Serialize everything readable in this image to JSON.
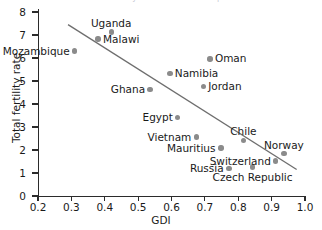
{
  "chart_data": {
    "type": "scatter",
    "title": "Global Fertility and Gender Development",
    "xlabel": "GDI",
    "ylabel": "Total fertility rate",
    "xlim": [
      0.2,
      1.0
    ],
    "ylim": [
      0,
      8
    ],
    "xticks": [
      "0.2",
      "0.3",
      "0.4",
      "0.5",
      "0.6",
      "0.7",
      "0.8",
      "0.9",
      "1.0"
    ],
    "yticks": [
      "0",
      "1",
      "2",
      "3",
      "4",
      "5",
      "6",
      "7",
      "8"
    ],
    "grid": false,
    "legend": "none",
    "point_color": "#8b8b8b",
    "trendline_color": "#6e6e6e",
    "trendline": {
      "x1": 0.29,
      "y1": 7.45,
      "x2": 0.975,
      "y2": 1.15
    },
    "points": [
      {
        "name": "Mozambique",
        "x": 0.31,
        "y": 6.3,
        "label_pos": "left"
      },
      {
        "name": "Uganda",
        "x": 0.42,
        "y": 7.13,
        "label_pos": "above"
      },
      {
        "name": "Malawi",
        "x": 0.38,
        "y": 6.82,
        "label_pos": "right"
      },
      {
        "name": "Ghana",
        "x": 0.535,
        "y": 4.62,
        "label_pos": "left"
      },
      {
        "name": "Namibia",
        "x": 0.595,
        "y": 5.33,
        "label_pos": "right"
      },
      {
        "name": "Oman",
        "x": 0.715,
        "y": 5.96,
        "label_pos": "right"
      },
      {
        "name": "Jordan",
        "x": 0.695,
        "y": 4.75,
        "label_pos": "right"
      },
      {
        "name": "Egypt",
        "x": 0.618,
        "y": 3.42,
        "label_pos": "left"
      },
      {
        "name": "Vietnam",
        "x": 0.675,
        "y": 2.56,
        "label_pos": "left"
      },
      {
        "name": "Mauritius",
        "x": 0.748,
        "y": 2.08,
        "label_pos": "left"
      },
      {
        "name": "Chile",
        "x": 0.815,
        "y": 2.42,
        "label_pos": "above"
      },
      {
        "name": "Russia",
        "x": 0.772,
        "y": 1.2,
        "label_pos": "left"
      },
      {
        "name": "Czech Republic",
        "x": 0.843,
        "y": 1.26,
        "label_pos": "below"
      },
      {
        "name": "Switzerland",
        "x": 0.912,
        "y": 1.52,
        "label_pos": "left"
      },
      {
        "name": "Norway",
        "x": 0.937,
        "y": 1.84,
        "label_pos": "above"
      }
    ]
  }
}
